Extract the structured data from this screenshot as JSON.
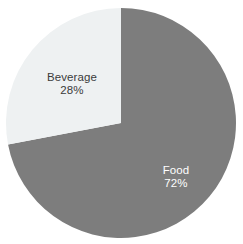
{
  "chart_data": {
    "type": "pie",
    "title": "",
    "subtitle": "",
    "xlabel": "",
    "ylabel": "",
    "grid": false,
    "legend": "none",
    "labels_inside_slices": true,
    "background_color": "#ffffff",
    "categories": [
      "Food",
      "Beverage"
    ],
    "values": [
      72,
      28
    ],
    "unit": "%",
    "slices": [
      {
        "name": "Food",
        "value": 72,
        "value_text": "72%",
        "color": "#7d7d7d",
        "label_color": "#ffffff",
        "start_angle_deg": 0,
        "end_angle_deg": 259.2
      },
      {
        "name": "Beverage",
        "value": 28,
        "value_text": "28%",
        "color": "#eef1f2",
        "label_color": "#3b3b3b",
        "start_angle_deg": 259.2,
        "end_angle_deg": 360
      }
    ],
    "geometry": {
      "center_x": 121,
      "center_y": 123,
      "radius": 115
    },
    "annotations": [
      {
        "name": "Beverage",
        "value_text": "28%"
      },
      {
        "name": "Food",
        "value_text": "72%"
      }
    ]
  }
}
